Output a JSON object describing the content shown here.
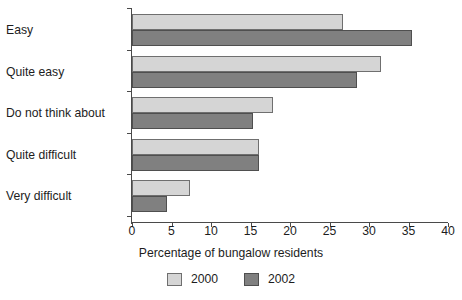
{
  "chart_data": {
    "type": "bar",
    "orientation": "horizontal",
    "title": "",
    "xlabel": "Percentage of bungalow residents",
    "ylabel": "",
    "categories": [
      "Easy",
      "Quite easy",
      "Do not think about",
      "Quite difficult",
      "Very difficult"
    ],
    "series": [
      {
        "name": "2000",
        "color": "#d5d5d5",
        "values": [
          26.7,
          31.5,
          17.9,
          16.1,
          7.3
        ]
      },
      {
        "name": "2002",
        "color": "#808080",
        "values": [
          35.4,
          28.5,
          15.3,
          16.1,
          4.4
        ]
      }
    ],
    "xlim": [
      0,
      40
    ],
    "xticks": [
      0,
      5,
      10,
      15,
      20,
      25,
      30,
      35,
      40
    ],
    "xtick_labels": [
      "0",
      "5",
      "10",
      "15",
      "20",
      "25",
      "30",
      "35",
      "40"
    ],
    "grid": false,
    "legend_position": "bottom"
  },
  "legend": {
    "items": [
      {
        "label": "2000"
      },
      {
        "label": "2002"
      }
    ]
  }
}
